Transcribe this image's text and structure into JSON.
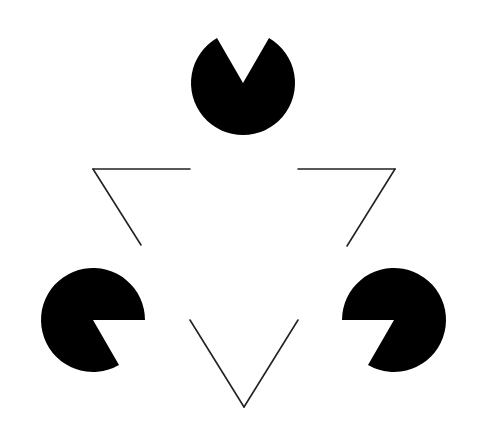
{
  "figure": {
    "title": "Kanizsa triangle illusion",
    "background": "#ffffff",
    "ink": "#000000",
    "line_color": "#222222",
    "pacmen": [
      {
        "name": "top",
        "cx": 243,
        "cy": 83,
        "r": 52,
        "mouth_direction_deg": 90
      },
      {
        "name": "bottom-left",
        "cx": 93,
        "cy": 320,
        "r": 52,
        "mouth_direction_deg": -30
      },
      {
        "name": "bottom-right",
        "cx": 394,
        "cy": 320,
        "r": 52,
        "mouth_direction_deg": 210
      }
    ],
    "outline_triangle": {
      "vertices": [
        [
          93,
          169
        ],
        [
          395,
          169
        ],
        [
          244,
          407
        ]
      ],
      "segments": [
        [
          [
            93,
            169
          ],
          [
            190,
            169
          ]
        ],
        [
          [
            93,
            169
          ],
          [
            141,
            245
          ]
        ],
        [
          [
            298,
            169
          ],
          [
            395,
            169
          ]
        ],
        [
          [
            395,
            169
          ],
          [
            347,
            246
          ]
        ],
        [
          [
            190,
            320
          ],
          [
            244,
            407
          ]
        ],
        [
          [
            244,
            407
          ],
          [
            298,
            320
          ]
        ]
      ]
    }
  }
}
